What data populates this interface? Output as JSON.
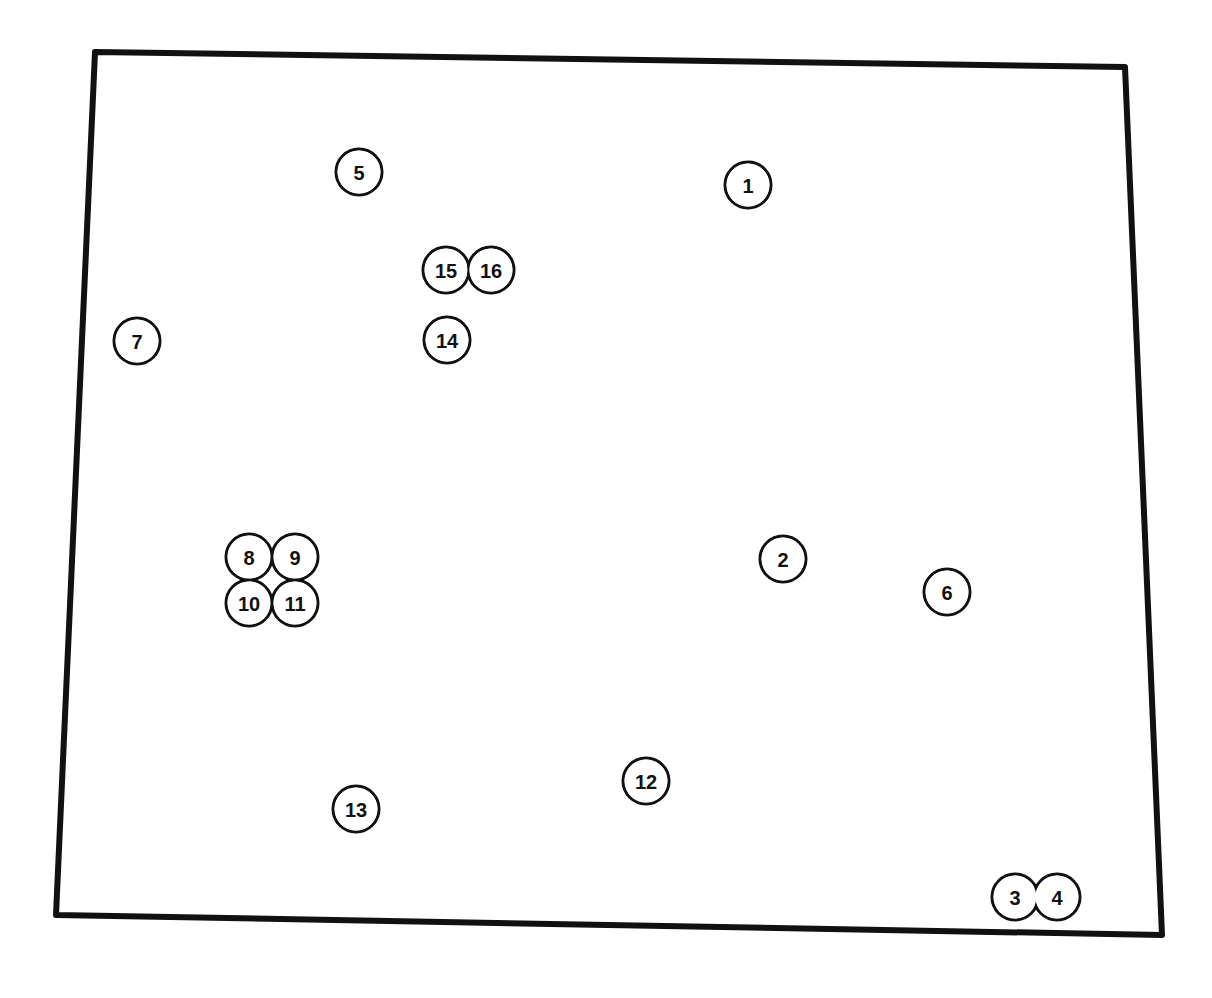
{
  "map": {
    "outline_color": "#111111",
    "background": "#ffffff",
    "boundary": [
      [
        95,
        52
      ],
      [
        1125,
        67
      ],
      [
        1162,
        935
      ],
      [
        56,
        915
      ]
    ],
    "marker_radius": 23,
    "markers": [
      {
        "id": "1",
        "x": 748,
        "y": 185
      },
      {
        "id": "2",
        "x": 783,
        "y": 559
      },
      {
        "id": "3",
        "x": 1015,
        "y": 897
      },
      {
        "id": "4",
        "x": 1057,
        "y": 897
      },
      {
        "id": "5",
        "x": 359,
        "y": 172
      },
      {
        "id": "6",
        "x": 947,
        "y": 592
      },
      {
        "id": "7",
        "x": 137,
        "y": 341
      },
      {
        "id": "8",
        "x": 249,
        "y": 557
      },
      {
        "id": "9",
        "x": 295,
        "y": 557
      },
      {
        "id": "10",
        "x": 249,
        "y": 603
      },
      {
        "id": "11",
        "x": 295,
        "y": 603
      },
      {
        "id": "12",
        "x": 646,
        "y": 781
      },
      {
        "id": "13",
        "x": 356,
        "y": 809
      },
      {
        "id": "14",
        "x": 447,
        "y": 340
      },
      {
        "id": "15",
        "x": 446,
        "y": 270
      },
      {
        "id": "16",
        "x": 491,
        "y": 270
      }
    ],
    "groups": [
      {
        "name": "pair-15-16",
        "members": [
          "15",
          "16"
        ]
      },
      {
        "name": "quad-8-9-10-11",
        "members": [
          "8",
          "9",
          "10",
          "11"
        ]
      },
      {
        "name": "pair-3-4",
        "members": [
          "3",
          "4"
        ]
      }
    ]
  }
}
